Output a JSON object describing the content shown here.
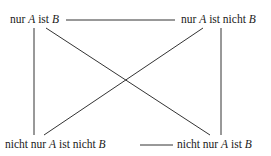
{
  "diagram": {
    "type": "square-of-opposition",
    "nodes": {
      "top_left": {
        "pre": "nur ",
        "a": "A",
        "mid": " ist ",
        "b": "B",
        "post": ""
      },
      "top_right": {
        "pre": "nur ",
        "a": "A",
        "mid": " ist nicht ",
        "b": "B",
        "post": ""
      },
      "bottom_left": {
        "pre": "nicht nur ",
        "a": "A",
        "mid": " ist nicht ",
        "b": "B",
        "post": ""
      },
      "bottom_right": {
        "pre": "nicht nur ",
        "a": "A",
        "mid": " ist ",
        "b": "B",
        "post": ""
      }
    },
    "edges": [
      {
        "from": "top_left",
        "to": "top_right",
        "kind": "horizontal"
      },
      {
        "from": "bottom_left",
        "to": "bottom_right",
        "kind": "horizontal"
      },
      {
        "from": "top_left",
        "to": "bottom_left",
        "kind": "vertical"
      },
      {
        "from": "top_right",
        "to": "bottom_right",
        "kind": "vertical"
      },
      {
        "from": "top_left",
        "to": "bottom_right",
        "kind": "diagonal"
      },
      {
        "from": "top_right",
        "to": "bottom_left",
        "kind": "diagonal"
      }
    ],
    "line_color": "#333333"
  }
}
